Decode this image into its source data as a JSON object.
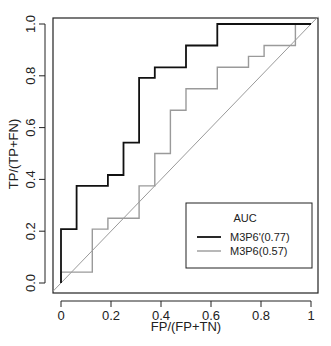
{
  "chart_data": {
    "type": "line",
    "subtype": "roc-step",
    "title": "",
    "xlabel": "FP/(FP+TN)",
    "ylabel": "TP/(TP+FN)",
    "xlim": [
      0,
      1
    ],
    "ylim": [
      0,
      1
    ],
    "x_ticks": [
      "0",
      "0.2",
      "0.4",
      "0.6",
      "0.8",
      "1"
    ],
    "y_ticks": [
      "0.0",
      "0.2",
      "0.4",
      "0.6",
      "0.8",
      "1.0"
    ],
    "grid": false,
    "legend": {
      "title": "AUC",
      "position": "bottom-right",
      "entries": [
        {
          "label": "M3P6'(0.77)",
          "color": "#111111"
        },
        {
          "label": "M3P6(0.57)",
          "color": "#9a9a9a"
        }
      ]
    },
    "reference_line": {
      "type": "diagonal",
      "from": [
        0,
        0
      ],
      "to": [
        1,
        1
      ],
      "color": "#9a9a9a"
    },
    "series": [
      {
        "name": "M3P6'",
        "auc": 0.77,
        "color": "#111111",
        "x": [
          0,
          0,
          0.0625,
          0.0625,
          0.1875,
          0.1875,
          0.25,
          0.25,
          0.3125,
          0.3125,
          0.375,
          0.375,
          0.5,
          0.5,
          0.625,
          0.625,
          1.0
        ],
        "y": [
          0,
          0.208,
          0.208,
          0.375,
          0.375,
          0.417,
          0.417,
          0.542,
          0.542,
          0.792,
          0.792,
          0.833,
          0.833,
          0.917,
          0.917,
          1.0,
          1.0
        ]
      },
      {
        "name": "M3P6",
        "auc": 0.57,
        "color": "#9a9a9a",
        "x": [
          0,
          0,
          0.125,
          0.125,
          0.1875,
          0.1875,
          0.3125,
          0.3125,
          0.375,
          0.375,
          0.4375,
          0.4375,
          0.5,
          0.5,
          0.625,
          0.625,
          0.75,
          0.75,
          0.8125,
          0.8125,
          0.9375,
          0.9375,
          1.0
        ],
        "y": [
          0,
          0.042,
          0.042,
          0.208,
          0.208,
          0.25,
          0.25,
          0.375,
          0.375,
          0.5,
          0.5,
          0.667,
          0.667,
          0.75,
          0.75,
          0.833,
          0.833,
          0.875,
          0.875,
          0.917,
          0.917,
          1.0,
          1.0
        ]
      }
    ]
  },
  "axes": {
    "xlabel": "FP/(FP+TN)",
    "ylabel": "TP/(TP+FN)",
    "x_ticks": [
      "0",
      "0.2",
      "0.4",
      "0.6",
      "0.8",
      "1"
    ],
    "y_ticks": [
      "0.0",
      "0.2",
      "0.4",
      "0.6",
      "0.8",
      "1.0"
    ]
  },
  "legend": {
    "title": "AUC",
    "entries": [
      "M3P6'(0.77)",
      "M3P6(0.57)"
    ]
  }
}
